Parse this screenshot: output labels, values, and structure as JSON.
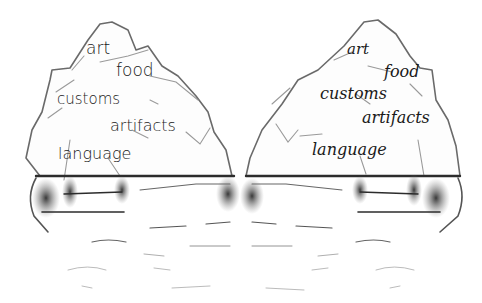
{
  "image": {
    "description": "Pencil drawing of two mirrored icebergs; the portion above the waterline is labeled with visible aspects of culture.",
    "background_color": "#ffffff",
    "line_color": "#3a3a3a"
  },
  "left_iceberg": {
    "labels": [
      {
        "text": "art",
        "x": 86,
        "y": 42,
        "size": 17
      },
      {
        "text": "food",
        "x": 117,
        "y": 66,
        "size": 17
      },
      {
        "text": "customs",
        "x": 57,
        "y": 94,
        "size": 15
      },
      {
        "text": "artifacts",
        "x": 110,
        "y": 120,
        "size": 16
      },
      {
        "text": "language",
        "x": 58,
        "y": 148,
        "size": 16
      }
    ]
  },
  "right_iceberg": {
    "labels": [
      {
        "text": "art",
        "x": 346,
        "y": 45,
        "size": 15
      },
      {
        "text": "food",
        "x": 384,
        "y": 66,
        "size": 16
      },
      {
        "text": "customs",
        "x": 320,
        "y": 87,
        "size": 16
      },
      {
        "text": "artifacts",
        "x": 362,
        "y": 112,
        "size": 16
      },
      {
        "text": "language",
        "x": 312,
        "y": 146,
        "size": 16
      }
    ]
  }
}
